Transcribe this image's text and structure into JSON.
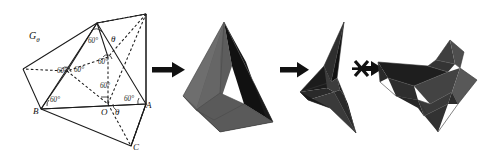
{
  "figure": {
    "background_color": "#ffffff",
    "ink_color": "#1b1b1b"
  },
  "crease_pattern": {
    "name": "crease-pattern-diagram",
    "family_label": "G",
    "family_subscript": "θ",
    "family_label_full": "Gθ",
    "vertices": [
      {
        "id": "A",
        "label": "A",
        "x": 146,
        "y": 104
      },
      {
        "id": "B",
        "label": "B",
        "x": 41,
        "y": 109
      },
      {
        "id": "C",
        "label": "C",
        "x": 131,
        "y": 146
      },
      {
        "id": "O",
        "label": "O",
        "x": 108,
        "y": 111
      }
    ],
    "theta_labels": [
      {
        "label": "θ",
        "x": 113,
        "y": 112
      },
      {
        "label": "θ",
        "x": 110,
        "y": 39
      }
    ],
    "angle_labels": [
      {
        "label": "60°",
        "x": 94,
        "y": 40
      },
      {
        "label": "60°",
        "x": 102,
        "y": 62
      },
      {
        "label": "60°",
        "x": 77,
        "y": 79
      },
      {
        "label": "60°",
        "x": 79,
        "y": 68
      },
      {
        "label": "60°",
        "x": 62,
        "y": 71
      },
      {
        "label": "60°",
        "x": 60,
        "y": 99
      },
      {
        "label": "60°",
        "x": 125,
        "y": 99
      }
    ]
  },
  "steps": [
    {
      "index": 1,
      "name": "arrow-step-1",
      "icon": "right-arrow-icon",
      "symbol": "→",
      "crossed_out": false
    },
    {
      "index": 2,
      "name": "arrow-step-2",
      "icon": "right-arrow-icon",
      "symbol": "→",
      "crossed_out": false
    },
    {
      "index": 3,
      "name": "arrow-step-3-blocked",
      "icon": "crossed-right-arrow-icon",
      "symbol": "⇸",
      "crossed_out": true
    }
  ],
  "shapes": [
    {
      "index": 1,
      "name": "tetrahedron-model",
      "description": "shaded tetrahedron",
      "face_colors": [
        "#6e6e6e",
        "#565656",
        "#3d3d3d",
        "#111111",
        "#8a8a8a"
      ]
    },
    {
      "index": 2,
      "name": "three-point-star-model",
      "description": "three pointed spiky star polyhedron",
      "face_colors": [
        "#2a2a2a",
        "#111111",
        "#4a4a4a",
        "#6a6a6a"
      ]
    },
    {
      "index": 3,
      "name": "folded-flat-model",
      "description": "collapsed folded polyhedron",
      "face_colors": [
        "#3a3a3a",
        "#2a2a2a",
        "#4e4e4e",
        "#1c1c1c",
        "#616161"
      ]
    }
  ]
}
